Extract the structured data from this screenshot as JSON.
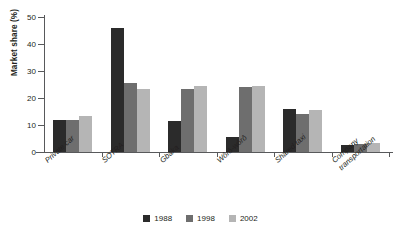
{
  "chart_data": {
    "type": "bar",
    "title": "",
    "xlabel": "",
    "ylabel": "Market share (%)",
    "ylim": [
      0,
      50
    ],
    "yticks": [
      0,
      10,
      20,
      30,
      40,
      50
    ],
    "grid": false,
    "legend_position": "bottom-center",
    "categories": [
      "Private car",
      "SOTRA",
      "Gbaka",
      "Wôrô-wôrô",
      "Shared taxi",
      "Company\ntransportation"
    ],
    "series": [
      {
        "name": "1988",
        "color": "#2b2b2b",
        "values": [
          12,
          46,
          11.5,
          5.5,
          16,
          2.5
        ]
      },
      {
        "name": "1998",
        "color": "#6e6e6e",
        "values": [
          12,
          25.5,
          23.5,
          24,
          14,
          3
        ]
      },
      {
        "name": "2002",
        "color": "#b5b5b5",
        "values": [
          13.5,
          23.5,
          24.5,
          24.5,
          15.5,
          3.5
        ]
      }
    ]
  }
}
